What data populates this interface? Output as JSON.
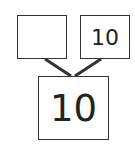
{
  "diagram": {
    "type": "number-bond",
    "parts": [
      {
        "value": ""
      },
      {
        "value": "10"
      }
    ],
    "whole": {
      "value": "10"
    },
    "colors": {
      "stroke": "#333333",
      "text": "#222222",
      "background": "#ffffff"
    }
  }
}
